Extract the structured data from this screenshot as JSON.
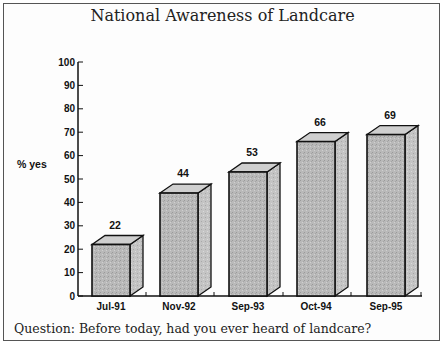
{
  "chart_data": {
    "type": "bar",
    "title": "National Awareness of Landcare",
    "xlabel": "",
    "ylabel": "% yes",
    "ylim": [
      0,
      100
    ],
    "yticks": [
      0,
      10,
      20,
      30,
      40,
      50,
      60,
      70,
      80,
      90,
      100
    ],
    "categories": [
      "Jul-91",
      "Nov-92",
      "Sep-93",
      "Oct-94",
      "Sep-95"
    ],
    "values": [
      22,
      44,
      53,
      66,
      69
    ],
    "grid": false,
    "legend": null,
    "style": "3d-bars",
    "bar_color": "#b8b8b8",
    "annotation": "Question:  Before today, had you ever heard of landcare?"
  }
}
